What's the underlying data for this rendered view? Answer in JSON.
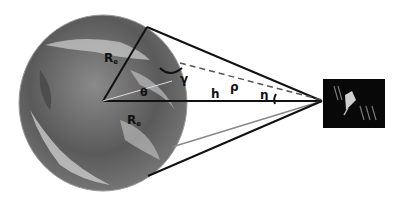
{
  "diagram": {
    "labels": {
      "earth_radius_top": "R",
      "earth_radius_top_sub": "e",
      "earth_radius_bottom": "R",
      "earth_radius_bottom_sub": "e",
      "nadir_angle": "γ",
      "earth_central_angle": "θ",
      "altitude": "h",
      "slant_range": "ρ",
      "elevation_angle": "η"
    },
    "elements": [
      "earth",
      "satellite",
      "tangent-lines",
      "line-of-sight-dashed"
    ]
  }
}
